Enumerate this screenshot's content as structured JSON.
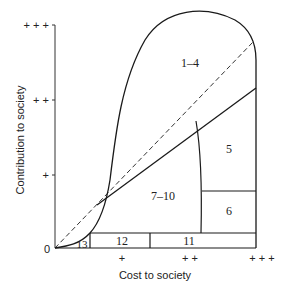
{
  "diagram": {
    "xlabel": "Cost to society",
    "ylabel": "Contribution to society",
    "origin_label": "0",
    "x_ticks": [
      "+",
      "+ +",
      "+ + +"
    ],
    "y_ticks": [
      "+",
      "+ +",
      "+ + +"
    ],
    "regions": [
      {
        "id": "1-4",
        "label": "1–4"
      },
      {
        "id": "5",
        "label": "5"
      },
      {
        "id": "6",
        "label": "6"
      },
      {
        "id": "7-10",
        "label": "7–10"
      },
      {
        "id": "11",
        "label": "11"
      },
      {
        "id": "12",
        "label": "12"
      },
      {
        "id": "13",
        "label": "13"
      }
    ],
    "line_color": "#1a1a1a"
  }
}
